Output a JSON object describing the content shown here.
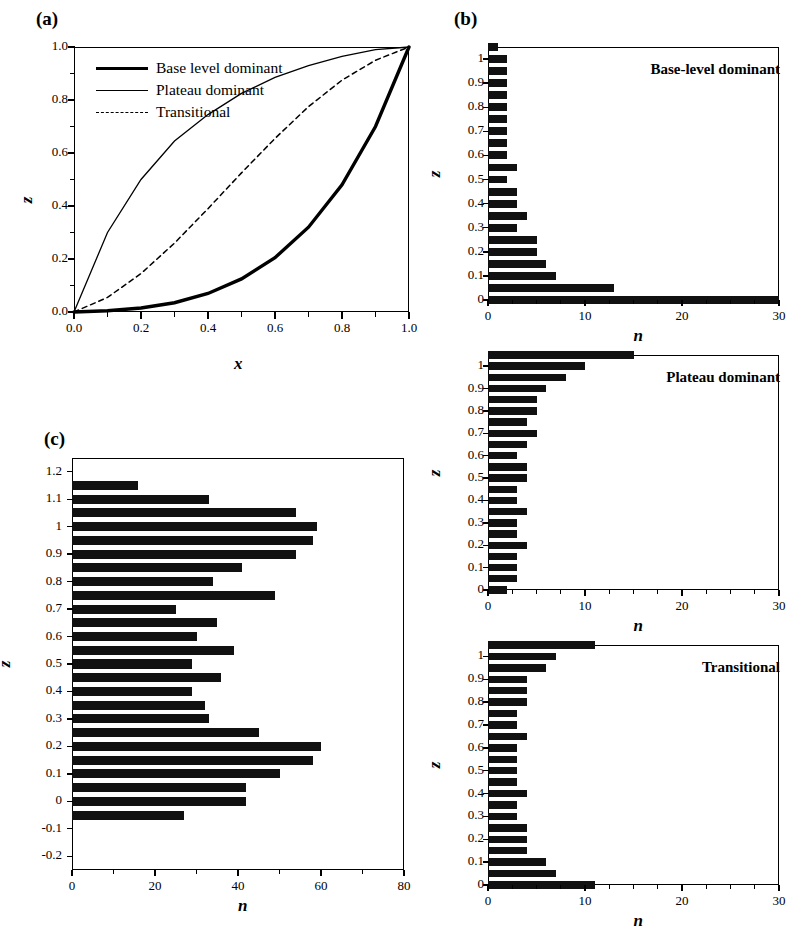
{
  "figure": {
    "panel_a_label": "(a)",
    "panel_b_label": "(b)",
    "panel_c_label": "(c)"
  },
  "chart_data": [
    {
      "id": "panel_a",
      "type": "line",
      "title": "",
      "xlabel": "x",
      "ylabel": "z",
      "xlim": [
        0,
        1
      ],
      "ylim": [
        0,
        1
      ],
      "xticks": [
        "0.0",
        "0.2",
        "0.4",
        "0.6",
        "0.8",
        "1.0"
      ],
      "yticks": [
        "0.0",
        "0.2",
        "0.4",
        "0.6",
        "0.8",
        "1.0"
      ],
      "grid": false,
      "legend_position": "upper-left",
      "series": [
        {
          "name": "Base level dominant",
          "style": "thick-solid",
          "x": [
            0.0,
            0.1,
            0.2,
            0.3,
            0.4,
            0.5,
            0.6,
            0.7,
            0.8,
            0.9,
            1.0
          ],
          "values": [
            0.0,
            0.005,
            0.015,
            0.035,
            0.07,
            0.125,
            0.205,
            0.32,
            0.48,
            0.7,
            1.0
          ]
        },
        {
          "name": "Plateau dominant",
          "style": "thin-solid",
          "x": [
            0.0,
            0.1,
            0.2,
            0.3,
            0.4,
            0.5,
            0.6,
            0.7,
            0.8,
            0.9,
            1.0
          ],
          "values": [
            0.0,
            0.3,
            0.5,
            0.645,
            0.745,
            0.825,
            0.885,
            0.93,
            0.965,
            0.99,
            1.0
          ]
        },
        {
          "name": "Transitional",
          "style": "dashed",
          "x": [
            0.0,
            0.1,
            0.2,
            0.3,
            0.4,
            0.5,
            0.6,
            0.7,
            0.8,
            0.9,
            1.0
          ],
          "values": [
            0.0,
            0.055,
            0.145,
            0.26,
            0.39,
            0.525,
            0.655,
            0.775,
            0.875,
            0.95,
            1.0
          ]
        }
      ]
    },
    {
      "id": "panel_b_top",
      "type": "bar",
      "orientation": "horizontal",
      "title": "Base-level dominant",
      "xlabel": "n",
      "ylabel": "z",
      "xlim": [
        0,
        30
      ],
      "ylim": [
        0,
        1.05
      ],
      "xticks": [
        "0",
        "10",
        "20",
        "30"
      ],
      "yticks": [
        "0",
        "0.1",
        "0.2",
        "0.3",
        "0.4",
        "0.5",
        "0.6",
        "0.7",
        "0.8",
        "0.9",
        "1"
      ],
      "categories": [
        1.05,
        1.0,
        0.95,
        0.9,
        0.85,
        0.8,
        0.75,
        0.7,
        0.65,
        0.6,
        0.55,
        0.5,
        0.45,
        0.4,
        0.35,
        0.3,
        0.25,
        0.2,
        0.15,
        0.1,
        0.05,
        0.0
      ],
      "values": [
        1,
        2,
        2,
        2,
        2,
        2,
        2,
        2,
        2,
        2,
        3,
        2,
        3,
        3,
        4,
        3,
        5,
        5,
        6,
        7,
        13,
        30
      ]
    },
    {
      "id": "panel_b_middle",
      "type": "bar",
      "orientation": "horizontal",
      "title": "Plateau dominant",
      "xlabel": "n",
      "ylabel": "z",
      "xlim": [
        0,
        30
      ],
      "ylim": [
        0,
        1.05
      ],
      "xticks": [
        "0",
        "10",
        "20",
        "30"
      ],
      "yticks": [
        "0",
        "0.1",
        "0.2",
        "0.3",
        "0.4",
        "0.5",
        "0.6",
        "0.7",
        "0.8",
        "0.9",
        "1"
      ],
      "categories": [
        1.05,
        1.0,
        0.95,
        0.9,
        0.85,
        0.8,
        0.75,
        0.7,
        0.65,
        0.6,
        0.55,
        0.5,
        0.45,
        0.4,
        0.35,
        0.3,
        0.25,
        0.2,
        0.15,
        0.1,
        0.05,
        0.0
      ],
      "values": [
        15,
        10,
        8,
        6,
        5,
        5,
        4,
        5,
        4,
        3,
        4,
        4,
        3,
        3,
        4,
        3,
        3,
        4,
        3,
        3,
        3,
        2
      ]
    },
    {
      "id": "panel_b_bottom",
      "type": "bar",
      "orientation": "horizontal",
      "title": "Transitional",
      "xlabel": "n",
      "ylabel": "z",
      "xlim": [
        0,
        30
      ],
      "ylim": [
        0,
        1.05
      ],
      "xticks": [
        "0",
        "10",
        "20",
        "30"
      ],
      "yticks": [
        "0",
        "0.1",
        "0.2",
        "0.3",
        "0.4",
        "0.5",
        "0.6",
        "0.7",
        "0.8",
        "0.9",
        "1"
      ],
      "categories": [
        1.05,
        1.0,
        0.95,
        0.9,
        0.85,
        0.8,
        0.75,
        0.7,
        0.65,
        0.6,
        0.55,
        0.5,
        0.45,
        0.4,
        0.35,
        0.3,
        0.25,
        0.2,
        0.15,
        0.1,
        0.05,
        0.0
      ],
      "values": [
        11,
        7,
        6,
        4,
        4,
        4,
        3,
        3,
        4,
        3,
        3,
        3,
        3,
        4,
        3,
        3,
        4,
        4,
        4,
        6,
        7,
        11
      ]
    },
    {
      "id": "panel_c",
      "type": "bar",
      "orientation": "horizontal",
      "title": "",
      "xlabel": "n",
      "ylabel": "z",
      "xlim": [
        0,
        80
      ],
      "ylim": [
        -0.25,
        1.25
      ],
      "xticks": [
        "0",
        "20",
        "40",
        "60",
        "80"
      ],
      "yticks": [
        "1.2",
        "1.1",
        "1",
        "0.9",
        "0.8",
        "0.7",
        "0.6",
        "0.5",
        "0.4",
        "0.3",
        "0.2",
        "0.1",
        "0",
        "-0.1",
        "-0.2"
      ],
      "categories": [
        1.15,
        1.1,
        1.05,
        1.0,
        0.95,
        0.9,
        0.85,
        0.8,
        0.75,
        0.7,
        0.65,
        0.6,
        0.55,
        0.5,
        0.45,
        0.4,
        0.35,
        0.3,
        0.25,
        0.2,
        0.15,
        0.1,
        0.05,
        0.0,
        -0.05,
        -0.1
      ],
      "values": [
        16,
        33,
        54,
        59,
        58,
        54,
        41,
        34,
        49,
        25,
        35,
        30,
        39,
        29,
        36,
        29,
        32,
        33,
        45,
        60,
        58,
        50,
        42,
        42,
        27,
        0
      ]
    }
  ]
}
